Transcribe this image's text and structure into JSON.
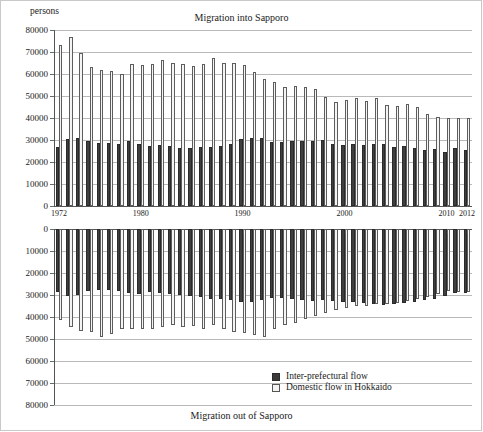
{
  "figure": {
    "units_label": "persons",
    "panels": [
      {
        "title": "Migration into Sapporo",
        "title_position": "top"
      },
      {
        "title": "Migration out of Sapporo",
        "title_position": "bottom"
      }
    ],
    "legend": {
      "items": [
        {
          "label": "Inter-prefectural flow",
          "swatch": "dark",
          "color": "#3f3f3f"
        },
        {
          "label": "Domestic flow in Hokkaido",
          "swatch": "light",
          "color": "#f4f4f4"
        }
      ]
    }
  },
  "chart_data": [
    {
      "type": "bar",
      "title": "Migration into Sapporo",
      "xlabel": "",
      "ylabel": "persons",
      "ylim": [
        0,
        80000
      ],
      "ytick_labels": [
        "0",
        "10000",
        "20000",
        "30000",
        "40000",
        "50000",
        "60000",
        "70000",
        "80000"
      ],
      "ytick_values": [
        0,
        10000,
        20000,
        30000,
        40000,
        50000,
        60000,
        70000,
        80000
      ],
      "grid": true,
      "legend_position": "bottom-center-of-figure",
      "direction": "up",
      "categories": [
        1972,
        1973,
        1974,
        1975,
        1976,
        1977,
        1978,
        1979,
        1980,
        1981,
        1982,
        1983,
        1984,
        1985,
        1986,
        1987,
        1988,
        1989,
        1990,
        1991,
        1992,
        1993,
        1994,
        1995,
        1996,
        1997,
        1998,
        1999,
        2000,
        2001,
        2002,
        2003,
        2004,
        2005,
        2006,
        2007,
        2008,
        2009,
        2010,
        2011,
        2012
      ],
      "xtick_labels": [
        "1972",
        "1980",
        "1990",
        "2000",
        "2010",
        "2012"
      ],
      "xtick_values": [
        1972,
        1980,
        1990,
        2000,
        2010,
        2012
      ],
      "series": [
        {
          "name": "Inter-prefectural flow",
          "color": "#3f3f3f",
          "values": [
            26800,
            30500,
            30900,
            29700,
            28600,
            28700,
            28000,
            29400,
            28300,
            27500,
            27800,
            27200,
            26400,
            26400,
            26800,
            26700,
            27400,
            28200,
            30500,
            30700,
            30800,
            29200,
            29200,
            29500,
            29400,
            29700,
            29800,
            28200,
            27700,
            28000,
            27700,
            28300,
            28000,
            26900,
            27100,
            26300,
            25400,
            26100,
            24700,
            26500,
            25500
          ]
        },
        {
          "name": "Domestic flow in Hokkaido",
          "color": "#f4f4f4",
          "values": [
            73300,
            76700,
            69700,
            63400,
            61600,
            61500,
            60100,
            64600,
            64200,
            64400,
            66500,
            64900,
            64700,
            63800,
            64700,
            67300,
            64800,
            64800,
            64200,
            61100,
            57800,
            56200,
            54000,
            54400,
            54100,
            53300,
            49700,
            47300,
            48400,
            49100,
            47900,
            49200,
            46100,
            45500,
            46300,
            45100,
            41900,
            40300,
            40000,
            40200,
            39900
          ]
        }
      ]
    },
    {
      "type": "bar",
      "title": "Migration out of Sapporo",
      "xlabel": "",
      "ylabel": "persons",
      "ylim": [
        0,
        80000
      ],
      "ytick_labels": [
        "0",
        "10000",
        "20000",
        "30000",
        "40000",
        "50000",
        "60000",
        "70000",
        "80000"
      ],
      "ytick_values": [
        0,
        10000,
        20000,
        30000,
        40000,
        50000,
        60000,
        70000,
        80000
      ],
      "grid": true,
      "direction": "down",
      "categories": [
        1972,
        1973,
        1974,
        1975,
        1976,
        1977,
        1978,
        1979,
        1980,
        1981,
        1982,
        1983,
        1984,
        1985,
        1986,
        1987,
        1988,
        1989,
        1990,
        1991,
        1992,
        1993,
        1994,
        1995,
        1996,
        1997,
        1998,
        1999,
        2000,
        2001,
        2002,
        2003,
        2004,
        2005,
        2006,
        2007,
        2008,
        2009,
        2010,
        2011,
        2012
      ],
      "xtick_labels": [
        "1972",
        "1980",
        "1990",
        "2000",
        "2010",
        "2012"
      ],
      "xtick_values": [
        1972,
        1980,
        1990,
        2000,
        2010,
        2012
      ],
      "series": [
        {
          "name": "Inter-prefectural flow",
          "color": "#3f3f3f",
          "values": [
            28700,
            30400,
            30100,
            28300,
            27500,
            27900,
            28400,
            29100,
            29400,
            28800,
            29300,
            29600,
            29800,
            30500,
            31000,
            31600,
            31700,
            32400,
            33400,
            33000,
            32400,
            31300,
            31200,
            31900,
            32100,
            32500,
            32400,
            32800,
            33000,
            33400,
            33500,
            34200,
            34600,
            34100,
            33700,
            33000,
            32400,
            31700,
            30400,
            29000,
            29100
          ]
        },
        {
          "name": "Domestic flow in Hokkaido",
          "color": "#f4f4f4",
          "values": [
            41300,
            44700,
            46400,
            46600,
            48900,
            47500,
            45500,
            45600,
            45600,
            45500,
            44700,
            43500,
            44600,
            44200,
            45600,
            43800,
            45300,
            46700,
            47200,
            48100,
            48900,
            45600,
            43800,
            42500,
            41100,
            39600,
            38400,
            37000,
            36100,
            35200,
            34900,
            34300,
            33900,
            33600,
            32600,
            31700,
            30900,
            29400,
            28300,
            28600,
            28700
          ]
        }
      ]
    }
  ]
}
